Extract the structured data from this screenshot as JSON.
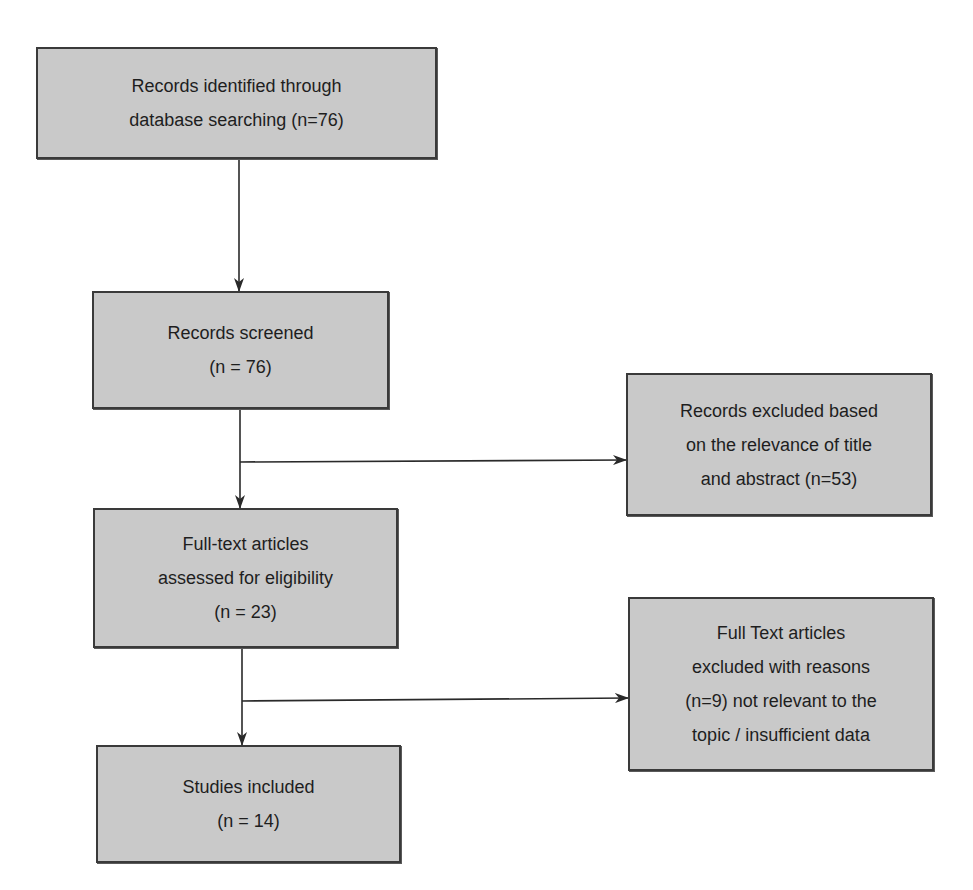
{
  "diagram": {
    "type": "flowchart",
    "style": {
      "box_fill": "#c9c9c9",
      "box_border": "#3a3a3a",
      "line_color": "#2a2a2a",
      "text_color": "#1e1e1e",
      "background": "#ffffff"
    },
    "nodes": [
      {
        "id": "identified",
        "lines": [
          "Records identified through",
          "database searching (n=76)"
        ]
      },
      {
        "id": "screened",
        "lines": [
          "Records screened",
          "(n = 76)"
        ]
      },
      {
        "id": "excluded_title_abstract",
        "lines": [
          "Records excluded based",
          "on the relevance of title",
          "and abstract (n=53)"
        ]
      },
      {
        "id": "fulltext_assessed",
        "lines": [
          "Full-text articles",
          "assessed for eligibility",
          "(n = 23)"
        ]
      },
      {
        "id": "fulltext_excluded",
        "lines": [
          "Full Text articles",
          "excluded with reasons",
          "(n=9) not relevant to the",
          "topic / insufficient data"
        ]
      },
      {
        "id": "included",
        "lines": [
          "Studies included",
          "(n = 14)"
        ]
      }
    ],
    "edges": [
      {
        "from": "identified",
        "to": "screened"
      },
      {
        "from": "screened",
        "to": "fulltext_assessed"
      },
      {
        "from": "screened",
        "to": "excluded_title_abstract"
      },
      {
        "from": "fulltext_assessed",
        "to": "included"
      },
      {
        "from": "fulltext_assessed",
        "to": "fulltext_excluded"
      }
    ]
  }
}
